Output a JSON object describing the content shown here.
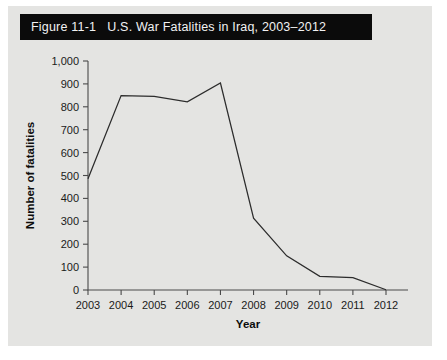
{
  "figure": {
    "title": "Figure 11-1   U.S. War Fatalities in Iraq, 2003–2012",
    "label": "Figure 11-1",
    "caption": "U.S. War Fatalities in Iraq, 2003–2012",
    "title_bar_color": "#0b0b0b",
    "title_text_color": "#f2f2f2",
    "card_background": "#e4e4e2"
  },
  "chart_data": {
    "type": "line",
    "title": "U.S. War Fatalities in Iraq, 2003–2012",
    "xlabel": "Year",
    "ylabel": "Number of fatalities",
    "categories": [
      "2003",
      "2004",
      "2005",
      "2006",
      "2007",
      "2008",
      "2009",
      "2010",
      "2011",
      "2012"
    ],
    "x": [
      2003,
      2004,
      2005,
      2006,
      2007,
      2008,
      2009,
      2010,
      2011,
      2012
    ],
    "values": [
      486,
      849,
      846,
      822,
      904,
      314,
      149,
      60,
      54,
      1
    ],
    "series": [
      {
        "name": "U.S. fatalities",
        "values": [
          486,
          849,
          846,
          822,
          904,
          314,
          149,
          60,
          54,
          1
        ]
      }
    ],
    "ylim": [
      0,
      1000
    ],
    "yticks": [
      0,
      100,
      200,
      300,
      400,
      500,
      600,
      700,
      800,
      900,
      1000
    ],
    "ytick_labels": [
      "0",
      "100",
      "200",
      "300",
      "400",
      "500",
      "600",
      "700",
      "800",
      "900",
      "1,000"
    ],
    "xtick_labels": [
      "2003",
      "2004",
      "2005",
      "2006",
      "2007",
      "2008",
      "2009",
      "2010",
      "2011",
      "2012"
    ],
    "grid": false,
    "legend": "none",
    "line_color": "#2c2c2c",
    "axis_color": "#4a4a4a",
    "plot_background": "#e4e4e2"
  }
}
